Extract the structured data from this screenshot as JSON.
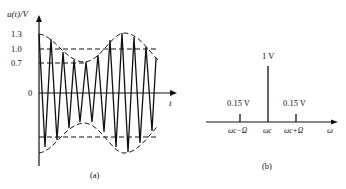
{
  "panel_a": {
    "y_axis_label": "u(t)/V",
    "x_axis_label": "t",
    "y_ticks": [
      "1.3",
      "1.0",
      "0.7",
      "0"
    ],
    "caption": "(a)"
  },
  "panel_b": {
    "x_axis_label": "ω",
    "spikes": [
      {
        "label": "0.15 V",
        "x_label": "ωc−Ω"
      },
      {
        "label": "1 V",
        "x_label": "ωc"
      },
      {
        "label": "0.15 V",
        "x_label": "ωc+Ω"
      }
    ],
    "caption": "(b)"
  }
}
